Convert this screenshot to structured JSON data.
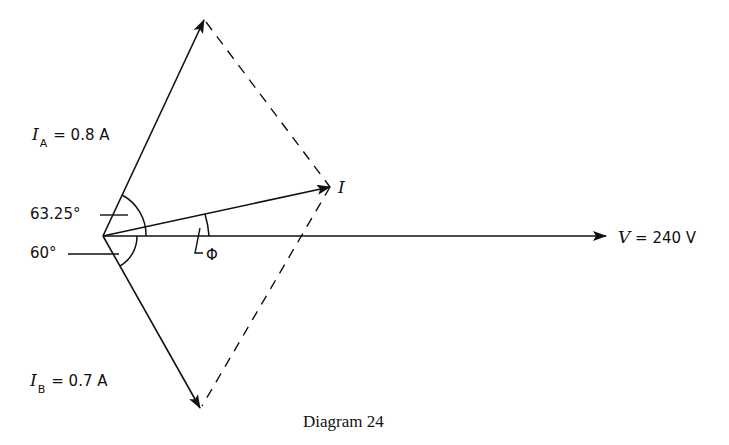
{
  "diagram": {
    "caption": "Diagram 24",
    "labels": {
      "IA": {
        "symbol": "I",
        "sub": "A",
        "value": "= 0.8 A"
      },
      "IB": {
        "symbol": "I",
        "sub": "B",
        "value": "= 0.7 A"
      },
      "I": {
        "symbol": "I"
      },
      "V": {
        "symbol": "V",
        "value": "= 240 V"
      },
      "angle_A": "63.25°",
      "angle_B": "60°",
      "phi": "Φ"
    },
    "colors": {
      "ink": "#111111",
      "background": "#ffffff"
    }
  }
}
